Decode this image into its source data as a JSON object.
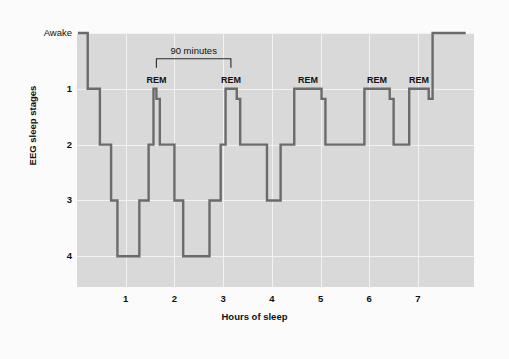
{
  "figure": {
    "background_color": "#fbfbfb",
    "plot_background_color": "#d9d9d9",
    "gridline_color": "#f2f2f2",
    "trace_color": "#6b6b6b"
  },
  "chart_data": {
    "type": "line",
    "title": "",
    "xlabel": "Hours of sleep",
    "ylabel": "EEG sleep stages",
    "xlim": [
      0,
      8.15
    ],
    "ylim": [
      0,
      4.55
    ],
    "grid": true,
    "legend": null,
    "x_ticks": [
      1,
      2,
      3,
      4,
      5,
      6,
      7
    ],
    "x_tick_labels": [
      "1",
      "2",
      "3",
      "4",
      "5",
      "6",
      "7"
    ],
    "y_ticks": [
      0,
      1,
      2,
      3,
      4
    ],
    "y_tick_labels": [
      "Awake",
      "1",
      "2",
      "3",
      "4"
    ],
    "series_name": "EEG sleep stage",
    "step_style": "post",
    "points": [
      [
        0.02,
        0
      ],
      [
        0.22,
        0
      ],
      [
        0.22,
        1
      ],
      [
        0.47,
        1
      ],
      [
        0.47,
        2
      ],
      [
        0.7,
        2
      ],
      [
        0.7,
        3
      ],
      [
        0.83,
        3
      ],
      [
        0.83,
        4
      ],
      [
        1.28,
        4
      ],
      [
        1.28,
        3
      ],
      [
        1.47,
        3
      ],
      [
        1.47,
        2
      ],
      [
        1.57,
        2
      ],
      [
        1.57,
        1
      ],
      [
        1.63,
        1
      ],
      [
        1.63,
        1.18
      ],
      [
        1.7,
        1.18
      ],
      [
        1.7,
        2
      ],
      [
        2.0,
        2
      ],
      [
        2.0,
        3
      ],
      [
        2.18,
        3
      ],
      [
        2.18,
        4
      ],
      [
        2.72,
        4
      ],
      [
        2.72,
        3
      ],
      [
        2.95,
        3
      ],
      [
        2.95,
        2
      ],
      [
        3.05,
        2
      ],
      [
        3.05,
        1
      ],
      [
        3.28,
        1
      ],
      [
        3.28,
        1.18
      ],
      [
        3.35,
        1.18
      ],
      [
        3.35,
        2
      ],
      [
        3.9,
        2
      ],
      [
        3.9,
        3
      ],
      [
        4.18,
        3
      ],
      [
        4.18,
        2
      ],
      [
        4.46,
        2
      ],
      [
        4.46,
        1
      ],
      [
        5.02,
        1
      ],
      [
        5.02,
        1.18
      ],
      [
        5.1,
        1.18
      ],
      [
        5.1,
        2
      ],
      [
        5.9,
        2
      ],
      [
        5.9,
        1
      ],
      [
        6.42,
        1
      ],
      [
        6.42,
        1.18
      ],
      [
        6.5,
        1.18
      ],
      [
        6.5,
        2
      ],
      [
        6.82,
        2
      ],
      [
        6.82,
        1
      ],
      [
        7.22,
        1
      ],
      [
        7.22,
        1.18
      ],
      [
        7.3,
        1.18
      ],
      [
        7.3,
        0
      ],
      [
        7.98,
        0
      ]
    ],
    "annotations": [
      {
        "name": "rem-1",
        "label": "REM",
        "x": 1.63,
        "y": 1
      },
      {
        "name": "rem-2",
        "label": "REM",
        "x": 3.16,
        "y": 1
      },
      {
        "name": "rem-3",
        "label": "REM",
        "x": 4.74,
        "y": 1
      },
      {
        "name": "rem-4",
        "label": "REM",
        "x": 6.16,
        "y": 1
      },
      {
        "name": "rem-5",
        "label": "REM",
        "x": 7.02,
        "y": 1
      }
    ],
    "bracket": {
      "label": "90 minutes",
      "x_start": 1.63,
      "x_end": 3.16,
      "y": 0.46
    }
  }
}
